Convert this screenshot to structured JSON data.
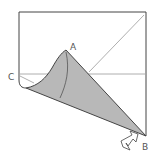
{
  "diagram": {
    "labels": {
      "a": "A",
      "b": "B",
      "c": "C"
    },
    "colors": {
      "flap": "#b8b8b8",
      "line": "#444444",
      "crease": "#999999"
    }
  }
}
